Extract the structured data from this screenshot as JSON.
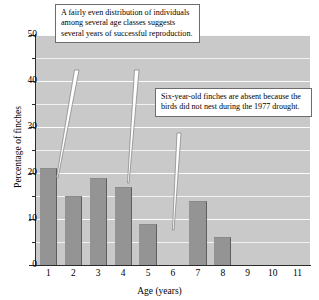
{
  "chart_data": {
    "type": "bar",
    "title": "",
    "xlabel": "Age (years)",
    "ylabel": "Percentage of finches",
    "categories": [
      "1",
      "2",
      "3",
      "4",
      "5",
      "6",
      "7",
      "8",
      "9",
      "10",
      "11"
    ],
    "values": [
      21,
      15,
      19,
      17,
      9,
      0,
      14,
      6,
      0,
      0,
      0
    ],
    "ylim": [
      0,
      50
    ],
    "ytick_labels": [
      "0",
      "10",
      "20",
      "30",
      "40",
      "50"
    ],
    "ytick_values": [
      0,
      10,
      20,
      30,
      40,
      50
    ],
    "yminor_values": [
      5,
      15,
      25,
      35,
      45
    ],
    "grid": true,
    "legend": null,
    "colors": {
      "bar_fill": "#949494",
      "bar_edge": "#5e5e5e",
      "plot_background": "#c9c9c9",
      "gridline": "#f7f7f7",
      "axis": "#2b2b2b",
      "callout_background": "#ffffff",
      "callout_border": "#6d6d6d",
      "text": "#000000"
    },
    "annotations": [
      {
        "id": "callout-1",
        "text": "A fairly even distribution of individuals among several age classes suggests several years of successful reproduction.",
        "points_to": [
          "1",
          "4"
        ]
      },
      {
        "id": "callout-2",
        "text": "Six-year-old finches are absent because the birds did not nest during the 1977 drought.",
        "points_to": [
          "6"
        ]
      }
    ]
  }
}
